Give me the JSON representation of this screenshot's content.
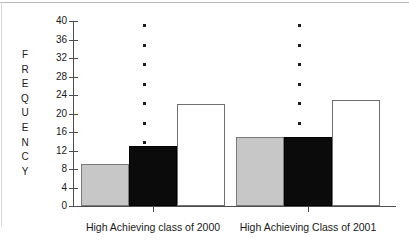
{
  "chart_data": {
    "type": "bar",
    "title": "",
    "xlabel": "",
    "ylabel": "FREQUENCY",
    "ylim": [
      0,
      40
    ],
    "ytick_labels": [
      "40",
      "36",
      "32",
      "28",
      "24",
      "20",
      "16",
      "12",
      "8",
      "4",
      "0"
    ],
    "ytick_values": [
      40,
      36,
      32,
      28,
      24,
      20,
      16,
      12,
      8,
      4,
      0
    ],
    "grid": false,
    "legend": "none",
    "categories": [
      "High Achieving class of 2000",
      "High Achieving Class of 2001"
    ],
    "series": [
      {
        "name": "gray",
        "color": "#c7c7c7",
        "values": [
          9,
          15
        ]
      },
      {
        "name": "black",
        "color": "#0b0b0b",
        "values": [
          13,
          15
        ]
      },
      {
        "name": "white",
        "color": "#ffffff",
        "values": [
          22,
          23
        ]
      }
    ],
    "annotations": [
      {
        "name": "dotted-separator-1",
        "dots": 8
      },
      {
        "name": "dotted-separator-2",
        "dots": 8
      }
    ]
  },
  "axis": {
    "y_title_letters": [
      "F",
      "R",
      "E",
      "Q",
      "U",
      "E",
      "N",
      "C",
      "Y"
    ]
  }
}
